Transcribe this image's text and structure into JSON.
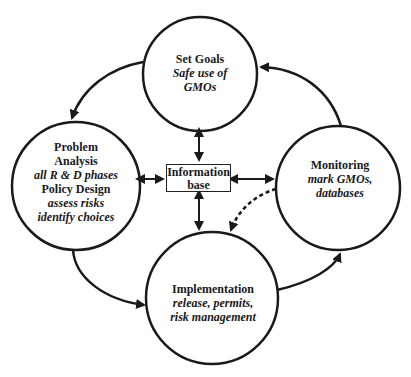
{
  "nodes": {
    "set_goals": {
      "title": "Set Goals",
      "detail_1": "Safe use of",
      "detail_2": "GMOs"
    },
    "problem_analysis": {
      "title_1": "Problem",
      "title_2": "Analysis",
      "detail_1": "all R & D phases",
      "title_3": "Policy Design",
      "detail_2": "assess risks",
      "detail_3": "identify choices"
    },
    "implementation": {
      "title": "Implementation",
      "detail_1": "release, permits,",
      "detail_2": "risk management"
    },
    "monitoring": {
      "title": "Monitoring",
      "detail_1": "mark GMOs,",
      "detail_2": "databases"
    },
    "information_base": {
      "line_1": "Information",
      "line_2": "base"
    }
  },
  "colors": {
    "stroke": "#1a1a1a",
    "background": "#ffffff"
  }
}
